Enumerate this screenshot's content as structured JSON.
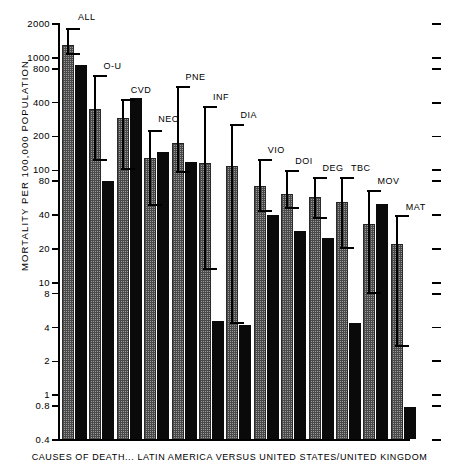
{
  "chart_data": {
    "type": "bar",
    "title": "CAUSES OF DEATH... LATIN AMERICA VERSUS UNITED STATES/UNITED KINGDOM",
    "xlabel": "CAUSES OF DEATH... LATIN AMERICA VERSUS UNITED STATES/UNITED KINGDOM",
    "ylabel": "MORTALITY PER 100,000 POPULATION",
    "yscale": "log",
    "ylim": [
      0.4,
      2000
    ],
    "grid": false,
    "legend": "none",
    "ytick_labels": [
      "2000",
      "1000",
      "800",
      "400",
      "200",
      "100",
      "80",
      "40",
      "20",
      "10",
      "8",
      "4",
      "2",
      "1",
      "0.8",
      "0.4"
    ],
    "ytick_values": [
      2000,
      1000,
      800,
      400,
      200,
      100,
      80,
      40,
      20,
      10,
      8,
      4,
      2,
      1,
      0.8,
      0.4
    ],
    "categories": [
      "ALL",
      "O-U",
      "CVD",
      "NEO",
      "PNE",
      "INF",
      "DIA",
      "VIO",
      "DOI",
      "DEG",
      "TBC",
      "MOV",
      "MAT"
    ],
    "series": [
      {
        "name": "Latin America",
        "style": "stippled-grey",
        "values": [
          1300,
          350,
          290,
          130,
          175,
          115,
          110,
          72,
          62,
          58,
          52,
          33,
          22
        ],
        "error_low": [
          1050,
          120,
          100,
          48,
          95,
          13,
          4.3,
          43,
          45,
          37,
          20,
          8.0,
          2.7
        ],
        "error_high": [
          1850,
          700,
          430,
          230,
          560,
          370,
          260,
          125,
          100,
          88,
          88,
          67,
          40
        ]
      },
      {
        "name": "United States / United Kingdom",
        "style": "solid-black",
        "values": [
          870,
          80,
          440,
          145,
          118,
          4.6,
          4.2,
          40,
          29,
          25,
          4.4,
          50,
          0.78
        ]
      }
    ],
    "series_labels": [
      "ALL",
      "O-U",
      "CVD",
      "NEO",
      "PNE",
      "INF",
      "DIA",
      "VIO",
      "DOI",
      "DEG",
      "TBC",
      "MOV",
      "MAT"
    ]
  },
  "axis": {
    "y_title": "MORTALITY  PER  100,000  POPULATION",
    "caption": "CAUSES  OF  DEATH...  LATIN  AMERICA  VERSUS  UNITED  STATES/UNITED KINGDOM"
  }
}
